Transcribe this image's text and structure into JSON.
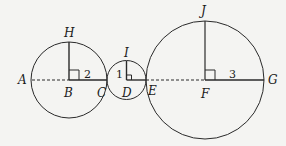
{
  "diagram": {
    "colors": {
      "stroke": "#2a2a2a",
      "background": "#f4f4f2"
    },
    "circles": [
      {
        "name": "circle-B",
        "center_label": "B",
        "radius_label": "2",
        "top_label": "H"
      },
      {
        "name": "circle-D",
        "center_label": "D",
        "radius_label": "1",
        "top_label": "I"
      },
      {
        "name": "circle-F",
        "center_label": "F",
        "radius_label": "3",
        "top_label": "J"
      }
    ],
    "points": {
      "A": "A",
      "B": "B",
      "C": "C",
      "D": "D",
      "E": "E",
      "F": "F",
      "G": "G",
      "H": "H",
      "I": "I",
      "J": "J"
    },
    "radius_labels": {
      "small": "1",
      "medium": "2",
      "large": "3"
    }
  }
}
